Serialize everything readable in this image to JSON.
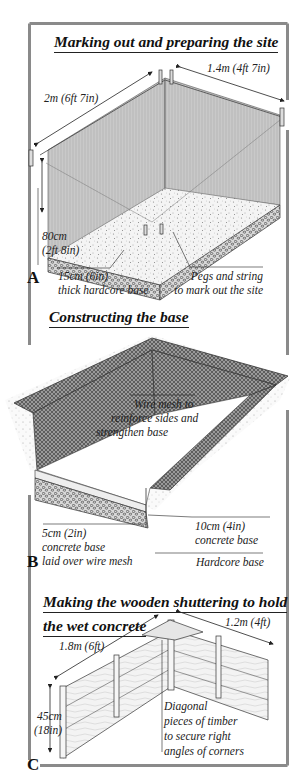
{
  "colors": {
    "frame": "#8a8a8a",
    "ink": "#1a1a1a",
    "background": "#ffffff"
  },
  "sections": [
    {
      "letter": "A",
      "title": "Marking out and preparing the site",
      "labels": {
        "length": "1.4m (4ft 7in)",
        "width": "2m (6ft 7in)",
        "depth_cm": "80cm",
        "depth_imperial": "(2ft 8in)",
        "hardcore_line1": "15cm (6in)",
        "hardcore_line2": "thick hardcore base",
        "pegs_line1": "Pegs and string",
        "pegs_line2": "to mark out the site"
      }
    },
    {
      "letter": "B",
      "title": "Constructing the base",
      "labels": {
        "mesh_line1": "Wire mesh to",
        "mesh_line2": "reinforce sides and",
        "mesh_line3": "strengthen base",
        "thin_line1": "5cm (2in)",
        "thin_line2": "concrete base",
        "thin_line3": "laid over wire mesh",
        "thick_line1": "10cm (4in)",
        "thick_line2": "concrete base",
        "hardcore": "Hardcore base"
      }
    },
    {
      "letter": "C",
      "title_line1": "Making the wooden shuttering to hold",
      "title_line2": "the wet concrete",
      "labels": {
        "long_side": "1.8m (6ft)",
        "short_side": "1.2m (4ft)",
        "height_cm": "45cm",
        "height_imperial": "(18in)",
        "diag_line1": "Diagonal",
        "diag_line2": "pieces of timber",
        "diag_line3": "to secure right",
        "diag_line4": "angles of corners"
      }
    }
  ]
}
